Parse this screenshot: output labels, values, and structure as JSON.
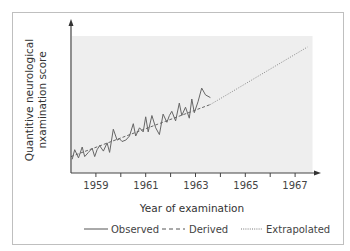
{
  "chart_data": {
    "type": "line",
    "title": "",
    "xlabel": "Year of examination",
    "ylabel": "Quantitive neurological nxamination score",
    "ylabel_lines": [
      "Quantitive neurological",
      "nxamination score"
    ],
    "xlim": [
      1958,
      1968
    ],
    "x_ticks": [
      1959,
      1961,
      1963,
      1965,
      1967
    ],
    "x_minor_ticks": [
      1960,
      1962,
      1964,
      1966
    ],
    "y_ticks": [],
    "grid": false,
    "legend_position": "bottom",
    "shaded_region": {
      "x_from": 1958,
      "x_to": 1967.7,
      "color": "#eeeeee"
    },
    "series": [
      {
        "name": "Observed",
        "style": "solid",
        "x": [
          1958.05,
          1958.15,
          1958.3,
          1958.45,
          1958.55,
          1958.7,
          1958.85,
          1958.95,
          1959.05,
          1959.15,
          1959.3,
          1959.45,
          1959.55,
          1959.7,
          1959.85,
          1959.95,
          1960.05,
          1960.2,
          1960.35,
          1960.5,
          1960.6,
          1960.75,
          1960.9,
          1961.0,
          1961.1,
          1961.25,
          1961.4,
          1961.55,
          1961.7,
          1961.85,
          1961.95,
          1962.05,
          1962.2,
          1962.35,
          1962.45,
          1962.6,
          1962.75,
          1962.85,
          1962.95,
          1963.1,
          1963.25,
          1963.4,
          1963.6
        ],
        "y": [
          0.1,
          0.17,
          0.11,
          0.19,
          0.12,
          0.15,
          0.18,
          0.12,
          0.17,
          0.2,
          0.16,
          0.22,
          0.15,
          0.32,
          0.24,
          0.25,
          0.23,
          0.24,
          0.27,
          0.36,
          0.27,
          0.33,
          0.3,
          0.41,
          0.3,
          0.42,
          0.33,
          0.28,
          0.43,
          0.37,
          0.42,
          0.45,
          0.38,
          0.51,
          0.42,
          0.48,
          0.4,
          0.54,
          0.44,
          0.52,
          0.62,
          0.57,
          0.55
        ]
      },
      {
        "name": "Derived",
        "style": "dashed",
        "x": [
          1958,
          1963.6
        ],
        "y": [
          0.12,
          0.5
        ]
      },
      {
        "name": "Extrapolated",
        "style": "dotted",
        "x": [
          1963.6,
          1967.5
        ],
        "y": [
          0.5,
          0.92
        ]
      }
    ]
  },
  "axes": {
    "xlabel": "Year of examination",
    "ylabel_line1": "Quantitive neurological",
    "ylabel_line2": "nxamination score",
    "ticks": [
      "1959",
      "1961",
      "1963",
      "1965",
      "1967"
    ]
  },
  "legend": {
    "observed": "Observed",
    "derived": "Derived",
    "extrapolated": "Extrapolated"
  },
  "colors": {
    "line": "#666666",
    "axis": "#444444",
    "shade": "#eeeeee",
    "frame": "#bfbfbf"
  }
}
